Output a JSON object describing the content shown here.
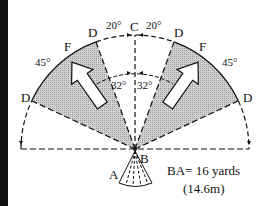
{
  "diagram": {
    "type": "field-of-view sector diagram",
    "points": {
      "center_label": "B",
      "top_label": "C",
      "bottom_label": "A",
      "boundary_label": "D",
      "sector_label": "F"
    },
    "angles": {
      "top_left": "20°",
      "top_right": "20°",
      "inner_left": "32°",
      "inner_right": "32°",
      "side_left": "45°",
      "side_right": "45°"
    },
    "caption": {
      "line1": "BA= 16 yards",
      "line2": "(14.6m)"
    },
    "colors": {
      "ink": "#111111",
      "shade": "#c8c8c8",
      "background": "#ffffff"
    }
  }
}
